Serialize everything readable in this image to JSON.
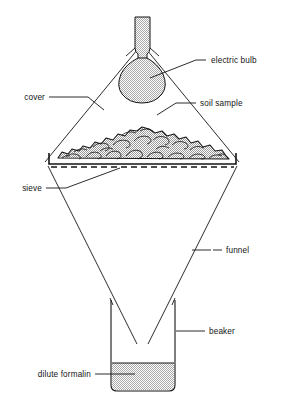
{
  "figure": {
    "background_color": "#ffffff",
    "line_color": "#141414",
    "fill_color": "#c9c9c9"
  },
  "labels": {
    "electric_bulb": "electric bulb",
    "cover": "cover",
    "soil_sample": "soil sample",
    "sieve": "sieve",
    "funnel": "funnel",
    "beaker": "beaker",
    "dilute_formalin": "dilute formalin"
  },
  "parts": [
    {
      "id": "electric-bulb",
      "label": "electric bulb",
      "filled": true
    },
    {
      "id": "cover",
      "label": "cover",
      "filled": false
    },
    {
      "id": "soil-sample",
      "label": "soil sample",
      "filled": true
    },
    {
      "id": "sieve",
      "label": "sieve",
      "filled": false
    },
    {
      "id": "funnel",
      "label": "funnel",
      "filled": false
    },
    {
      "id": "beaker",
      "label": "beaker",
      "filled": false
    },
    {
      "id": "dilute-formalin",
      "label": "dilute formalin",
      "filled": true
    }
  ]
}
